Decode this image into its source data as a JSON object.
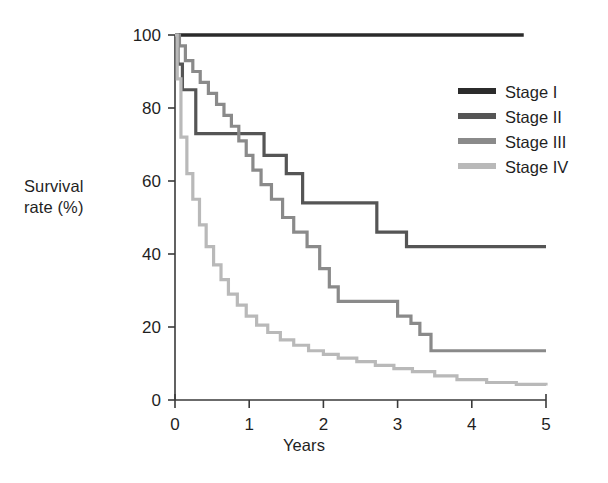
{
  "chart_data": {
    "type": "line",
    "subtype": "kaplan-meier-step",
    "title": "",
    "xlabel": "Years",
    "ylabel": "Survival rate (%)",
    "ylabel_lines": [
      "Survival",
      "rate (%)"
    ],
    "xlim": [
      0,
      5
    ],
    "ylim": [
      0,
      100
    ],
    "xticks": [
      0,
      1,
      2,
      3,
      4,
      5
    ],
    "xticklabels": [
      "0",
      "1",
      "2",
      "3",
      "4",
      "5"
    ],
    "yticks": [
      0,
      20,
      40,
      60,
      80,
      100
    ],
    "yticklabels": [
      "0",
      "20",
      "40",
      "60",
      "80",
      "100"
    ],
    "grid": false,
    "legend_position": "upper right",
    "legend_entries": [
      "Stage I",
      "Stage II",
      "Stage III",
      "Stage IV"
    ],
    "series": [
      {
        "name": "Stage I",
        "color": "#2b2b2b",
        "linewidth": 3.4,
        "end_x": 4.7,
        "final_value": 100,
        "x": [
          0,
          4.7
        ],
        "y": [
          100,
          100
        ]
      },
      {
        "name": "Stage II",
        "color": "#555555",
        "linewidth": 3.2,
        "end_x": 5,
        "final_value": 42,
        "x": [
          0,
          0.04,
          0.1,
          0.28,
          1.05,
          1.2,
          1.35,
          1.5,
          1.62,
          1.72,
          2.58,
          2.72,
          3.02,
          3.12,
          5
        ],
        "y": [
          100,
          92,
          85,
          73,
          73,
          67,
          67,
          62,
          62,
          54,
          54,
          46,
          46,
          42,
          42
        ]
      },
      {
        "name": "Stage III",
        "color": "#8a8a8a",
        "linewidth": 3.2,
        "end_x": 5,
        "final_value": 13.5,
        "x": [
          0,
          0.06,
          0.14,
          0.24,
          0.34,
          0.45,
          0.56,
          0.66,
          0.76,
          0.86,
          0.96,
          1.05,
          1.16,
          1.3,
          1.45,
          1.6,
          1.78,
          1.95,
          2.08,
          2.2,
          2.9,
          3.0,
          3.18,
          3.3,
          3.45,
          5
        ],
        "y": [
          100,
          97,
          93,
          90,
          87,
          84,
          81,
          78,
          75,
          71,
          67,
          63,
          59,
          55,
          50,
          46,
          42,
          36,
          31,
          27,
          27,
          23,
          21,
          18,
          13.5,
          13.5
        ]
      },
      {
        "name": "Stage IV",
        "color": "#b9b9b9",
        "linewidth": 3.2,
        "end_x": 5,
        "final_value": 4,
        "x": [
          0,
          0.03,
          0.08,
          0.16,
          0.24,
          0.33,
          0.42,
          0.52,
          0.62,
          0.72,
          0.84,
          0.96,
          1.1,
          1.25,
          1.42,
          1.6,
          1.8,
          2.0,
          2.2,
          2.45,
          2.7,
          2.95,
          3.2,
          3.5,
          3.8,
          4.2,
          4.6,
          5
        ],
        "y": [
          100,
          88,
          72,
          62,
          55,
          48,
          42,
          37,
          33,
          29,
          26,
          23,
          20.5,
          18.5,
          16.5,
          15,
          13.5,
          12.5,
          11.5,
          10.5,
          9.5,
          8.6,
          7.8,
          6.6,
          5.6,
          4.8,
          4.3,
          4
        ]
      }
    ]
  },
  "axes": {
    "axis_color": "#3a3a3a",
    "tick_font_size": 17
  }
}
